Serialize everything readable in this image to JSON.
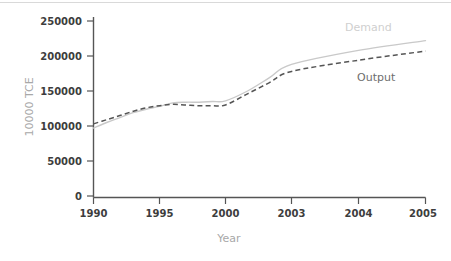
{
  "chart_data": {
    "type": "line",
    "title": "",
    "xlabel": "Year",
    "ylabel": "10000 TCE",
    "categories": [
      "1990",
      "1995",
      "2000",
      "2003",
      "2004",
      "2005"
    ],
    "x_tick_labels": [
      "1990",
      "1995",
      "2000",
      "2003",
      "2004",
      "2005"
    ],
    "y_tick_labels": [
      "0",
      "50000",
      "100000",
      "150000",
      "200000",
      "250000"
    ],
    "y_ticks": [
      0,
      50000,
      100000,
      150000,
      200000,
      250000
    ],
    "ylim": [
      0,
      250000
    ],
    "grid": false,
    "legend_position": "inline-right",
    "series": [
      {
        "name": "Demand",
        "style": "solid",
        "color": "#c9c9c9",
        "label_color": "#cfcfcf",
        "categories": [
          "1990",
          "1995",
          "2000",
          "2003",
          "2004",
          "2005"
        ],
        "values": [
          97000,
          128000,
          136000,
          188000,
          208000,
          222000
        ],
        "detailed_x": [
          "1990",
          "1991",
          "1992",
          "1993",
          "1994",
          "1995",
          "1996",
          "1997",
          "1998",
          "1999",
          "2000",
          "2001",
          "2002",
          "2003",
          "2004",
          "2005"
        ],
        "detailed_values": [
          97000,
          105000,
          112000,
          119000,
          124000,
          128000,
          133000,
          134000,
          134000,
          135000,
          136000,
          150000,
          169000,
          188000,
          208000,
          222000
        ]
      },
      {
        "name": "Output",
        "style": "dashed",
        "color": "#555555",
        "label_color": "#6e6e6e",
        "categories": [
          "1990",
          "1995",
          "2000",
          "2003",
          "2004",
          "2005"
        ],
        "values": [
          103000,
          129000,
          130000,
          178000,
          194000,
          207000
        ],
        "detailed_x": [
          "1990",
          "1991",
          "1992",
          "1993",
          "1994",
          "1995",
          "1996",
          "1997",
          "1998",
          "1999",
          "2000",
          "2001",
          "2002",
          "2003",
          "2004",
          "2005"
        ],
        "detailed_values": [
          103000,
          109000,
          115000,
          121000,
          126000,
          129000,
          131000,
          130000,
          129000,
          129000,
          130000,
          146000,
          162000,
          178000,
          194000,
          207000
        ]
      }
    ],
    "annotations": [
      {
        "text": "Demand",
        "series": "Demand"
      },
      {
        "text": "Output",
        "series": "Output"
      }
    ]
  },
  "axes": {
    "x_title": "Year",
    "y_title": "10000 TCE"
  },
  "labels": {
    "demand": "Demand",
    "output": "Output",
    "y0": "0",
    "y50000": "50000",
    "y100000": "100000",
    "y150000": "150000",
    "y200000": "200000",
    "y250000": "250000",
    "x1990": "1990",
    "x1995": "1995",
    "x2000": "2000",
    "x2003": "2003",
    "x2004": "2004",
    "x2005": "2005"
  },
  "colors": {
    "demand_line": "#c9c9c9",
    "output_line": "#555555",
    "axis": "#555555",
    "tick_text": "#3d3d3d",
    "axis_title": "#a8a8a8",
    "background": "#ffffff"
  }
}
